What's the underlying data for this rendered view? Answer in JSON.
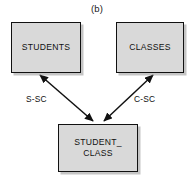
{
  "figure": {
    "caption": "(b)",
    "type": "entity-relationship-diagram",
    "background_color": "#ffffff",
    "node_fill_color": "#d9d9d9",
    "node_border_color": "#111111",
    "line_color": "#111111"
  },
  "nodes": [
    {
      "id": "students",
      "label": "STUDENTS",
      "role": "entity",
      "position": {
        "x": 11,
        "y": 22,
        "width": 70,
        "height": 51
      }
    },
    {
      "id": "classes",
      "label": "CLASSES",
      "role": "entity",
      "position": {
        "x": 116,
        "y": 22,
        "width": 68,
        "height": 51
      }
    },
    {
      "id": "student_class",
      "label": "STUDENT_\nCLASS",
      "role": "relationship",
      "position": {
        "x": 58,
        "y": 124,
        "width": 80,
        "height": 48
      }
    }
  ],
  "edges": [
    {
      "id": "s-sc",
      "label": "S-SC",
      "from": "students",
      "to": "student_class",
      "arrowheads": "both"
    },
    {
      "id": "c-sc",
      "label": "C-SC",
      "from": "classes",
      "to": "student_class",
      "arrowheads": "both"
    }
  ]
}
